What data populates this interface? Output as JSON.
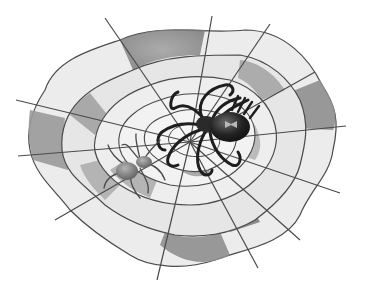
{
  "image": {
    "subject": "Two spiders on a spider web",
    "style": "grayscale cartoon illustration",
    "elements": [
      {
        "name": "spider-web",
        "description": "Irregular concentric spider web with shaded gray segments"
      },
      {
        "name": "large-spider",
        "description": "Large dark spider with long legs, upper right of center, light bow-shaped marking on abdomen"
      },
      {
        "name": "small-spider",
        "description": "Smaller gray spider, lower left of center"
      }
    ],
    "colors": {
      "background": "#ffffff",
      "web_light": "#ececec",
      "web_mid": "#bdbdbd",
      "web_dark": "#8f8f8f",
      "thread": "#4a4a4a",
      "large_spider": "#1e1e1e",
      "small_spider": "#6e6e6e"
    }
  }
}
